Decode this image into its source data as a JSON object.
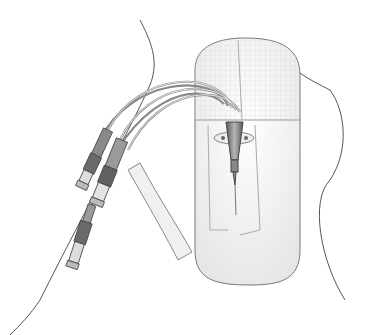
{
  "illustration": {
    "subject": "central venous catheter secured under transparent dressing on upper chest",
    "colors": {
      "background": "#ffffff",
      "outline": "#555555",
      "dressing_grid": "#d8d8d8",
      "hub_dark": "#6e6e6e",
      "hub_mid": "#9a9a9a",
      "strip_fill": "#efefef"
    },
    "parts": [
      "body-outline",
      "transparent-dressing",
      "catheter-hub",
      "lumen-tubes",
      "luer-connectors",
      "adhesive-strip"
    ]
  }
}
